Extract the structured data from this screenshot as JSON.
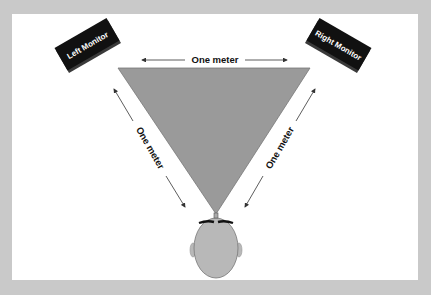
{
  "diagram": {
    "title": "",
    "colors": {
      "border": "#c9c9c9",
      "background": "#ffffff",
      "triangle": "#9a9a9a",
      "monitor": "#111111",
      "head": "#b8b8b8",
      "text": "#111111"
    },
    "monitors": {
      "left": {
        "label": "Left Monitor"
      },
      "right": {
        "label": "Right Monitor"
      }
    },
    "distances": {
      "top": "One meter",
      "left": "One meter",
      "right": "One meter"
    },
    "listener": {
      "label": ""
    }
  }
}
